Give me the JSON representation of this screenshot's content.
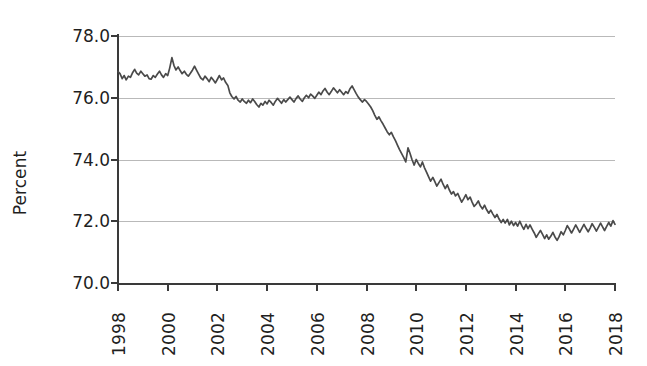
{
  "chart_data": {
    "type": "line",
    "title": "",
    "xlabel": "",
    "ylabel": "Percent",
    "xlim": [
      1998.0,
      2018.0
    ],
    "ylim": [
      70.0,
      78.0
    ],
    "grid": true,
    "legend": "none",
    "line_color": "#4a4a4a",
    "grid_color": "#b9b9b9",
    "axis_color": "#3a3a3a",
    "background_color": "#ffffff",
    "y_ticks": [
      "78.0",
      "76.0",
      "74.0",
      "72.0",
      "70.0"
    ],
    "y_tick_values": [
      78.0,
      76.0,
      74.0,
      72.0,
      70.0
    ],
    "x_ticks": [
      "1998",
      "2000",
      "2002",
      "2004",
      "2006",
      "2008",
      "2010",
      "2012",
      "2014",
      "2016",
      "2018"
    ],
    "x_tick_values": [
      1998,
      2000,
      2002,
      2004,
      2006,
      2008,
      2010,
      2012,
      2014,
      2016,
      2018
    ],
    "series": [
      {
        "name": "Labor force participation rate",
        "x": [
          1998.0,
          1998.08,
          1998.17,
          1998.25,
          1998.33,
          1998.42,
          1998.5,
          1998.58,
          1998.67,
          1998.75,
          1998.83,
          1998.92,
          1999.0,
          1999.08,
          1999.17,
          1999.25,
          1999.33,
          1999.42,
          1999.5,
          1999.58,
          1999.67,
          1999.75,
          1999.83,
          1999.92,
          2000.0,
          2000.08,
          2000.17,
          2000.25,
          2000.33,
          2000.42,
          2000.5,
          2000.58,
          2000.67,
          2000.75,
          2000.83,
          2000.92,
          2001.0,
          2001.08,
          2001.17,
          2001.25,
          2001.33,
          2001.42,
          2001.5,
          2001.58,
          2001.67,
          2001.75,
          2001.83,
          2001.92,
          2002.0,
          2002.08,
          2002.17,
          2002.25,
          2002.33,
          2002.42,
          2002.5,
          2002.58,
          2002.67,
          2002.75,
          2002.83,
          2002.92,
          2003.0,
          2003.08,
          2003.17,
          2003.25,
          2003.33,
          2003.42,
          2003.5,
          2003.58,
          2003.67,
          2003.75,
          2003.83,
          2003.92,
          2004.0,
          2004.08,
          2004.17,
          2004.25,
          2004.33,
          2004.42,
          2004.5,
          2004.58,
          2004.67,
          2004.75,
          2004.83,
          2004.92,
          2005.0,
          2005.08,
          2005.17,
          2005.25,
          2005.33,
          2005.42,
          2005.5,
          2005.58,
          2005.67,
          2005.75,
          2005.83,
          2005.92,
          2006.0,
          2006.08,
          2006.17,
          2006.25,
          2006.33,
          2006.42,
          2006.5,
          2006.58,
          2006.67,
          2006.75,
          2006.83,
          2006.92,
          2007.0,
          2007.08,
          2007.17,
          2007.25,
          2007.33,
          2007.42,
          2007.5,
          2007.58,
          2007.67,
          2007.75,
          2007.83,
          2007.92,
          2008.0,
          2008.08,
          2008.17,
          2008.25,
          2008.33,
          2008.42,
          2008.5,
          2008.58,
          2008.67,
          2008.75,
          2008.83,
          2008.92,
          2009.0,
          2009.08,
          2009.17,
          2009.25,
          2009.33,
          2009.42,
          2009.5,
          2009.58,
          2009.67,
          2009.75,
          2009.83,
          2009.92,
          2010.0,
          2010.08,
          2010.17,
          2010.25,
          2010.33,
          2010.42,
          2010.5,
          2010.58,
          2010.67,
          2010.75,
          2010.83,
          2010.92,
          2011.0,
          2011.08,
          2011.17,
          2011.25,
          2011.33,
          2011.42,
          2011.5,
          2011.58,
          2011.67,
          2011.75,
          2011.83,
          2011.92,
          2012.0,
          2012.08,
          2012.17,
          2012.25,
          2012.33,
          2012.42,
          2012.5,
          2012.58,
          2012.67,
          2012.75,
          2012.83,
          2012.92,
          2013.0,
          2013.08,
          2013.17,
          2013.25,
          2013.33,
          2013.42,
          2013.5,
          2013.58,
          2013.67,
          2013.75,
          2013.83,
          2013.92,
          2014.0,
          2014.08,
          2014.17,
          2014.25,
          2014.33,
          2014.42,
          2014.5,
          2014.58,
          2014.67,
          2014.75,
          2014.83,
          2014.92,
          2015.0,
          2015.08,
          2015.17,
          2015.25,
          2015.33,
          2015.42,
          2015.5,
          2015.58,
          2015.67,
          2015.75,
          2015.83,
          2015.92,
          2016.0,
          2016.08,
          2016.17,
          2016.25,
          2016.33,
          2016.42,
          2016.5,
          2016.58,
          2016.67,
          2016.75,
          2016.83,
          2016.92,
          2017.0,
          2017.08,
          2017.17,
          2017.25,
          2017.33,
          2017.42,
          2017.5,
          2017.58,
          2017.67,
          2017.75,
          2017.83,
          2017.92,
          2018.0
        ],
        "values": [
          76.85,
          76.78,
          76.62,
          76.72,
          76.58,
          76.7,
          76.66,
          76.8,
          76.92,
          76.8,
          76.74,
          76.86,
          76.78,
          76.7,
          76.74,
          76.62,
          76.6,
          76.72,
          76.66,
          76.76,
          76.86,
          76.74,
          76.66,
          76.78,
          76.72,
          76.96,
          77.3,
          77.05,
          76.9,
          77.0,
          76.88,
          76.78,
          76.86,
          76.76,
          76.7,
          76.8,
          76.9,
          77.02,
          76.88,
          76.76,
          76.64,
          76.58,
          76.7,
          76.62,
          76.52,
          76.66,
          76.58,
          76.48,
          76.6,
          76.72,
          76.58,
          76.64,
          76.5,
          76.4,
          76.16,
          76.04,
          75.96,
          76.04,
          75.92,
          75.86,
          75.96,
          75.88,
          75.82,
          75.92,
          75.84,
          75.96,
          75.88,
          75.78,
          75.7,
          75.82,
          75.76,
          75.88,
          75.8,
          75.92,
          75.84,
          75.76,
          75.88,
          75.98,
          75.9,
          75.82,
          75.94,
          75.86,
          75.94,
          76.02,
          75.94,
          75.86,
          75.98,
          76.06,
          75.96,
          75.88,
          76.0,
          76.08,
          76.0,
          76.12,
          76.06,
          75.98,
          76.08,
          76.18,
          76.1,
          76.22,
          76.3,
          76.18,
          76.1,
          76.2,
          76.32,
          76.24,
          76.16,
          76.26,
          76.18,
          76.1,
          76.2,
          76.14,
          76.28,
          76.38,
          76.26,
          76.14,
          76.02,
          75.94,
          75.86,
          75.94,
          75.88,
          75.8,
          75.7,
          75.58,
          75.44,
          75.3,
          75.38,
          75.26,
          75.14,
          75.02,
          74.9,
          74.8,
          74.88,
          74.74,
          74.6,
          74.46,
          74.32,
          74.18,
          74.06,
          73.92,
          74.38,
          74.2,
          74.0,
          73.82,
          74.0,
          73.88,
          73.76,
          73.92,
          73.74,
          73.58,
          73.44,
          73.3,
          73.42,
          73.28,
          73.14,
          73.26,
          73.36,
          73.2,
          73.06,
          73.18,
          73.02,
          72.88,
          72.96,
          72.82,
          72.9,
          72.76,
          72.62,
          72.74,
          72.86,
          72.7,
          72.78,
          72.62,
          72.48,
          72.56,
          72.66,
          72.5,
          72.4,
          72.52,
          72.38,
          72.26,
          72.36,
          72.24,
          72.12,
          72.22,
          72.08,
          71.96,
          72.06,
          71.94,
          72.06,
          71.88,
          72.0,
          71.86,
          71.96,
          71.84,
          72.0,
          71.86,
          71.74,
          71.9,
          71.76,
          71.88,
          71.74,
          71.62,
          71.48,
          71.6,
          71.7,
          71.58,
          71.44,
          71.56,
          71.42,
          71.52,
          71.64,
          71.5,
          71.38,
          71.5,
          71.66,
          71.56,
          71.7,
          71.86,
          71.74,
          71.62,
          71.74,
          71.88,
          71.76,
          71.64,
          71.78,
          71.9,
          71.78,
          71.66,
          71.78,
          71.92,
          71.8,
          71.68,
          71.8,
          71.94,
          71.82,
          71.7,
          71.84,
          71.96,
          71.84,
          72.02,
          71.9
        ]
      }
    ]
  },
  "axis": {
    "y_title": "Percent"
  }
}
